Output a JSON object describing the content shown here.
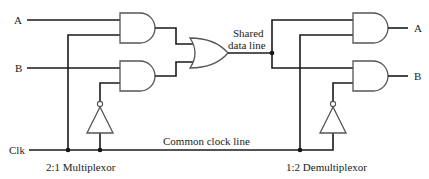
{
  "diagram": {
    "type": "logic-circuit",
    "labels": {
      "input_a": "A",
      "input_b": "B",
      "clock": "Clk",
      "shared_line_1": "Shared",
      "shared_line_2": "data line",
      "clock_line": "Common clock line",
      "mux": "2:1 Multiplexor",
      "demux": "1:2 Demultiplexor",
      "output_a": "A",
      "output_b": "B"
    },
    "components": {
      "multiplexor": {
        "gates": [
          "and-gate",
          "and-gate",
          "or-gate",
          "not-gate"
        ]
      },
      "demultiplexor": {
        "gates": [
          "and-gate",
          "and-gate",
          "not-gate"
        ]
      }
    },
    "colors": {
      "wire": "#1a1a1a",
      "gate_outline": "#555555",
      "background": "#ffffff"
    }
  }
}
